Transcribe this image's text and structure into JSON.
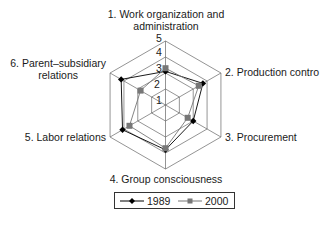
{
  "chart_data": {
    "type": "radar",
    "title": "",
    "categories": [
      "1. Work organization and administration",
      "2. Production contro",
      "3. Procurement",
      "4. Group consciousness",
      "5. Labor relations",
      "6. Parent–subsidiary relations"
    ],
    "series": [
      {
        "name": "1989",
        "marker": "diamond",
        "color": "#000000",
        "values": [
          3.1,
          3.7,
          3.0,
          3.8,
          4.1,
          4.2
        ]
      },
      {
        "name": "2000",
        "marker": "square",
        "color": "#777777",
        "values": [
          3.3,
          3.4,
          2.6,
          3.7,
          3.6,
          2.8
        ]
      }
    ],
    "radial_axis": {
      "min": 1,
      "max": 5,
      "ticks": [
        "1",
        "2",
        "3",
        "4",
        "5"
      ]
    },
    "grid": true,
    "legend_position": "bottom"
  },
  "labels": {
    "axis1_line1": "1. Work organization and",
    "axis1_line2": "administration",
    "axis2": "2. Production contro",
    "axis3": "3. Procurement",
    "axis4": "4. Group consciousness",
    "axis5": "5. Labor relations",
    "axis6_line1": "6. Parent–subsidiary",
    "axis6_line2": "relations"
  },
  "ticks": {
    "t1": "1",
    "t2": "2",
    "t3": "3",
    "t4": "4",
    "t5": "5"
  },
  "legend": {
    "s1": "1989",
    "s2": "2000"
  }
}
